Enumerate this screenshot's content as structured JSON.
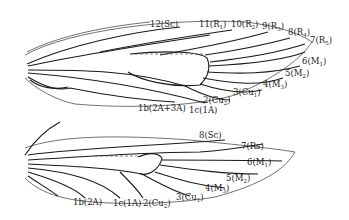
{
  "figure": {
    "forewing": {
      "labels": [
        {
          "id": "12",
          "vein": "Sc",
          "text": "12(Sc)"
        },
        {
          "id": "11",
          "vein": "R1",
          "text": "11(R",
          "sub": "1",
          "close": ")"
        },
        {
          "id": "10",
          "vein": "R2",
          "text": "10(R",
          "sub": "2",
          "close": ")"
        },
        {
          "id": "9",
          "vein": "R3",
          "text": "9(R",
          "sub": "3",
          "close": ")"
        },
        {
          "id": "8",
          "vein": "R4",
          "text": "8(R",
          "sub": "4",
          "close": ")"
        },
        {
          "id": "7",
          "vein": "R5",
          "text": "7(R",
          "sub": "5",
          "close": ")"
        },
        {
          "id": "6",
          "vein": "M1",
          "text": "6(M",
          "sub": "1",
          "close": ")"
        },
        {
          "id": "5",
          "vein": "M2",
          "text": "5(M",
          "sub": "2",
          "close": ")"
        },
        {
          "id": "4",
          "vein": "M3",
          "text": "4(M",
          "sub": "3",
          "close": ")"
        },
        {
          "id": "3",
          "vein": "Cu1",
          "text": "3(Cu",
          "sub": "1",
          "close": ")"
        },
        {
          "id": "2",
          "vein": "Cu2",
          "text": "2(Cu",
          "sub": "2",
          "close": ")"
        },
        {
          "id": "1c",
          "vein": "1A",
          "text": "1c(1A)"
        },
        {
          "id": "1b",
          "vein": "2A+3A",
          "text": "1b(2A+3A)"
        }
      ]
    },
    "hindwing": {
      "labels": [
        {
          "id": "8",
          "vein": "Sc",
          "text": "8(Sc)"
        },
        {
          "id": "7",
          "vein": "Rs",
          "text": "7(Rs)"
        },
        {
          "id": "6",
          "vein": "M1",
          "text": "6(M",
          "sub": "1",
          "close": ")"
        },
        {
          "id": "5",
          "vein": "M2",
          "text": "5(M",
          "sub": "2",
          "close": ")"
        },
        {
          "id": "4",
          "vein": "M3",
          "text": "4(M",
          "sub": "3",
          "close": ")"
        },
        {
          "id": "3",
          "vein": "Cu1",
          "text": "3(Cu",
          "sub": "1",
          "close": ")"
        },
        {
          "id": "2",
          "vein": "Cu2",
          "text": "2(Cu",
          "sub": "2",
          "close": ")"
        },
        {
          "id": "1c",
          "vein": "1A",
          "text": "1c(1A)"
        },
        {
          "id": "1b",
          "vein": "2A",
          "text": "1b(2A)"
        }
      ]
    }
  }
}
